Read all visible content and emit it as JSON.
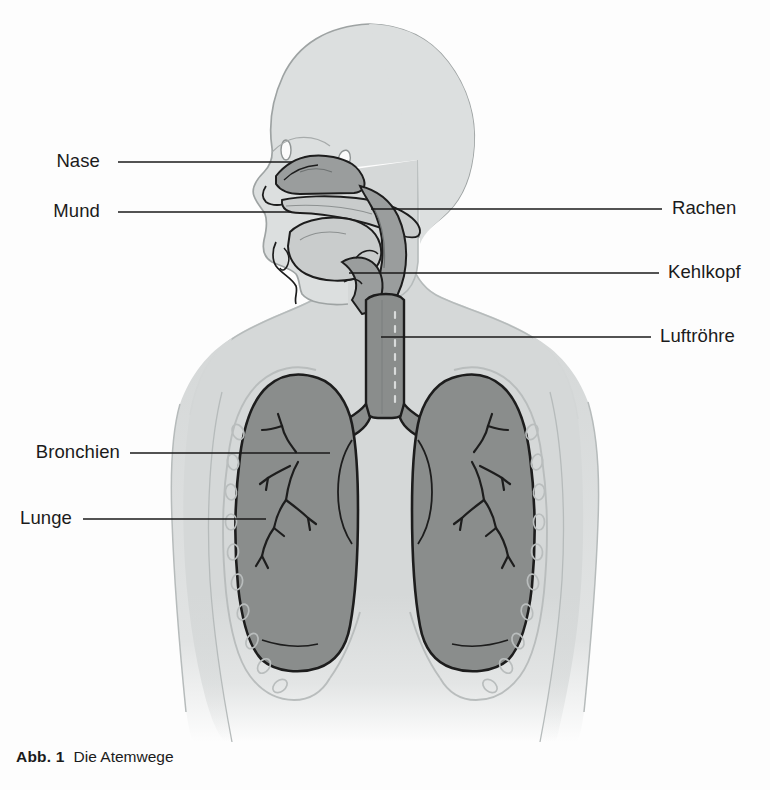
{
  "figure": {
    "caption_number": "Abb. 1",
    "caption_text": "Die Atemwege",
    "alt_title": "Die Atemwege"
  },
  "labels": {
    "left": [
      {
        "id": "nase",
        "text": "Nase",
        "text_x": 100,
        "text_y": 162,
        "line_x1": 118,
        "line_x2": 292,
        "line_y": 162
      },
      {
        "id": "mund",
        "text": "Mund",
        "text_x": 100,
        "text_y": 212,
        "line_x1": 118,
        "line_x2": 291,
        "line_y": 212
      },
      {
        "id": "bronchien",
        "text": "Bronchien",
        "text_x": 120,
        "text_y": 453,
        "line_x1": 130,
        "line_x2": 330,
        "line_y": 453
      },
      {
        "id": "lunge",
        "text": "Lunge",
        "text_x": 72,
        "text_y": 519,
        "line_x1": 83,
        "line_x2": 266,
        "line_y": 519
      }
    ],
    "right": [
      {
        "id": "rachen",
        "text": "Rachen",
        "text_x": 672,
        "text_y": 209,
        "line_x1": 371,
        "line_x2": 662,
        "line_y": 209
      },
      {
        "id": "kehlkopf",
        "text": "Kehlkopf",
        "text_x": 668,
        "text_y": 273,
        "line_x1": 349,
        "line_x2": 659,
        "line_y": 273
      },
      {
        "id": "luftroehre",
        "text": "Luftröhre",
        "text_x": 660,
        "text_y": 337,
        "line_x1": 381,
        "line_x2": 651,
        "line_y": 337
      }
    ]
  },
  "colors": {
    "background": "#fdfdfd",
    "body_silhouette": "#d5d8d8",
    "body_outline": "#b6bbbb",
    "head_fill": "#dcdfdf",
    "airway_mid": "#9a9d9d",
    "airway_dark": "#8a8d8c",
    "lung_fill": "#8a8d8c",
    "lung_outline": "#1d1d1d",
    "tissue_light": "#c9cccc",
    "rib_stroke": "#b9bdbd",
    "leader_line": "#1a1a1a",
    "text": "#1b1b1b"
  },
  "anatomy_parts": [
    {
      "name": "head-silhouette"
    },
    {
      "name": "nasal-cavity"
    },
    {
      "name": "oral-cavity"
    },
    {
      "name": "tongue"
    },
    {
      "name": "pharynx"
    },
    {
      "name": "larynx"
    },
    {
      "name": "trachea"
    },
    {
      "name": "left-lung"
    },
    {
      "name": "right-lung"
    },
    {
      "name": "bronchial-tree-left"
    },
    {
      "name": "bronchial-tree-right"
    },
    {
      "name": "rib-cage-outline"
    },
    {
      "name": "torso-silhouette"
    }
  ]
}
